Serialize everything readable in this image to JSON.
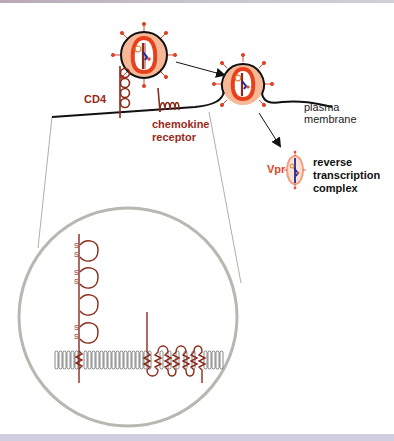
{
  "figure": {
    "labels": {
      "cd4": "CD4",
      "chemokine_line1": "chemokine",
      "chemokine_line2": "receptor",
      "plasma_line1": "plasma",
      "plasma_line2": "membrane",
      "vpr": "Vpr",
      "rtc_line1": "reverse",
      "rtc_line2": "transcription",
      "rtc_line3": "complex",
      "disulfide": "S",
      "disulfide_bond": "S-S"
    },
    "colors": {
      "virus_capsid": "#e8401c",
      "virus_envelope_fill": "#f6b896",
      "virus_membrane": "#111111",
      "protein_brown": "#8a2a1a",
      "rna_blue": "#1a2a9a",
      "zoom_circle": "#b8b8b0",
      "lipid_gray": "#555555",
      "bottom_bar": "#cfcde0"
    },
    "elements": [
      "free-virion",
      "fusing-virion",
      "cd4-receptor",
      "chemokine-receptor",
      "plasma-membrane",
      "reverse-transcription-complex",
      "zoom-inset-circle",
      "lipid-bilayer",
      "cd4-domains-with-disulfide-bonds",
      "seven-transmembrane-receptor"
    ]
  }
}
